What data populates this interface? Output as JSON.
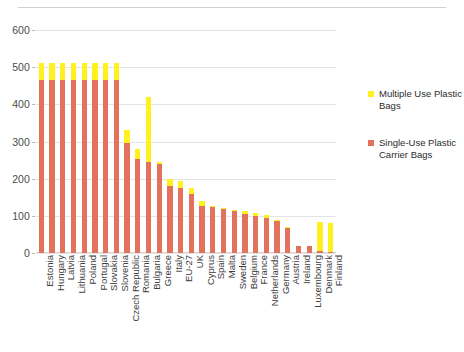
{
  "figure": {
    "top_rule": true,
    "background": "#ffffff"
  },
  "legend": {
    "position": "right",
    "entries": [
      {
        "label": "Multiple Use Plastic Bags",
        "color": "#FFF01F",
        "key": "multiple_use"
      },
      {
        "label": "Single-Use Plastic Carrier Bags",
        "color": "#E2725B",
        "key": "single_use"
      }
    ]
  },
  "axis": {
    "y_ticks": [
      0,
      100,
      200,
      300,
      400,
      500,
      600
    ],
    "y_tick_labels": [
      "0",
      "100",
      "200",
      "300",
      "400",
      "500",
      "600"
    ],
    "y_min": 0,
    "y_max": 600
  },
  "chart_data": {
    "type": "bar",
    "subtype": "stacked-vertical",
    "title": "",
    "subtitle": "",
    "xlabel": "",
    "ylabel": "",
    "ylim": [
      0,
      600
    ],
    "yticks": [
      0,
      100,
      200,
      300,
      400,
      500,
      600
    ],
    "grid": true,
    "grid_axis": "y",
    "legend_position": "right",
    "colors": {
      "multiple_use": "#FFF01F",
      "single_use": "#E2725B"
    },
    "categories": [
      "Estonia",
      "Hungary",
      "Latvia",
      "Lithuania",
      "Poland",
      "Portugal",
      "Slovakia",
      "Slovenia",
      "Czech Republic",
      "Romania",
      "Bulgaria",
      "Greece",
      "Italy",
      "EU-27",
      "UK",
      "Cyprus",
      "Spain",
      "Malta",
      "Sweden",
      "Belgium",
      "France",
      "Netherlands",
      "Germany",
      "Austria",
      "Ireland",
      "Luxembourg",
      "Denmark",
      "Finland"
    ],
    "series": [
      {
        "name": "Single-Use Plastic Carrier Bags",
        "color": "#E2725B",
        "values": [
          466,
          466,
          466,
          466,
          466,
          466,
          466,
          466,
          297,
          253,
          245,
          240,
          180,
          175,
          158,
          127,
          123,
          118,
          112,
          106,
          100,
          94,
          86,
          68,
          20,
          20,
          5,
          4
        ]
      },
      {
        "name": "Multiple Use Plastic Bags",
        "color": "#FFF01F",
        "values": [
          46,
          46,
          46,
          46,
          46,
          46,
          46,
          46,
          35,
          27,
          175,
          4,
          19,
          19,
          18,
          12,
          2,
          1,
          1,
          8,
          7,
          8,
          1,
          1,
          0,
          0,
          78,
          78
        ]
      }
    ],
    "totals": [
      512,
      512,
      512,
      512,
      512,
      512,
      512,
      512,
      332,
      280,
      420,
      244,
      199,
      194,
      176,
      139,
      125,
      119,
      113,
      114,
      107,
      102,
      87,
      69,
      20,
      20,
      83,
      82
    ]
  }
}
